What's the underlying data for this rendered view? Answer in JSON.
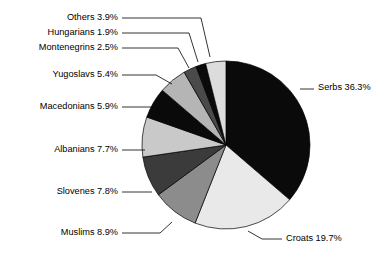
{
  "chart_data": {
    "type": "pie",
    "title": "",
    "subtitle": "",
    "xlabel": "",
    "ylabel": "",
    "legend_position": "none",
    "grid": false,
    "units": "percent",
    "total": 100.0,
    "start_angle_deg": 0,
    "direction": "clockwise",
    "categories": [
      "Serbs",
      "Croats",
      "Muslims",
      "Slovenes",
      "Albanians",
      "Macedonians",
      "Yugoslavs",
      "Montenegrins",
      "Hungarians",
      "Others"
    ],
    "values": [
      36.3,
      19.7,
      8.9,
      7.8,
      7.7,
      5.9,
      5.4,
      2.5,
      1.9,
      3.9
    ],
    "slices": [
      {
        "name": "Serbs",
        "value": 36.3,
        "label": "Serbs 36.3%",
        "color": "#0a0a0a",
        "label_side": "right",
        "label_x": 318,
        "label_y": 88,
        "leader": "M 300,89 L 314,89"
      },
      {
        "name": "Croats",
        "value": 19.7,
        "label": "Croats 19.7%",
        "color": "#e9e9e9",
        "label_side": "right",
        "label_x": 286,
        "label_y": 239,
        "leader": "M 248,231 L 262,239 L 282,239"
      },
      {
        "name": "Muslims",
        "value": 8.9,
        "label": "Muslims 8.9%",
        "color": "#8c8c8c",
        "label_side": "left",
        "label_x": 118,
        "label_y": 233,
        "leader": "M 122,233 L 160,233 L 172,222"
      },
      {
        "name": "Slovenes",
        "value": 7.8,
        "label": "Slovenes 7.8%",
        "color": "#3b3b3b",
        "label_side": "left",
        "label_x": 118,
        "label_y": 192,
        "leader": "M 122,192 L 152,192"
      },
      {
        "name": "Albanians",
        "value": 7.7,
        "label": "Albanians 7.7%",
        "color": "#c9c9c9",
        "label_side": "left",
        "label_x": 118,
        "label_y": 150,
        "leader": "M 122,150 L 145,150"
      },
      {
        "name": "Macedonians",
        "value": 5.9,
        "label": "Macedonians 5.9%",
        "color": "#0a0a0a",
        "label_side": "left",
        "label_x": 118,
        "label_y": 107,
        "leader": "M 122,107 L 154,107"
      },
      {
        "name": "Yugoslavs",
        "value": 5.4,
        "label": "Yugoslavs 5.4%",
        "color": "#b5b5b5",
        "label_side": "left",
        "label_x": 118,
        "label_y": 75,
        "leader": "M 122,75 L 156,75 L 172,84"
      },
      {
        "name": "Montenegrins",
        "value": 2.5,
        "label": "Montenegrins 2.5%",
        "color": "#4a4a4a",
        "label_side": "left",
        "label_x": 118,
        "label_y": 48,
        "leader": "M 122,48 L 178,48 L 189,68"
      },
      {
        "name": "Hungarians",
        "value": 1.9,
        "label": "Hungarians 1.9%",
        "color": "#0a0a0a",
        "label_side": "left",
        "label_x": 118,
        "label_y": 33,
        "leader": "M 122,33 L 189,33 L 198,62"
      },
      {
        "name": "Others",
        "value": 3.9,
        "label": "Others 3.9%",
        "color": "#dcdcdc",
        "label_side": "left",
        "label_x": 118,
        "label_y": 18,
        "leader": "M 122,18 L 201,18 L 210,57"
      }
    ],
    "geometry": {
      "center_x": 226,
      "center_y": 145,
      "radius": 84
    }
  }
}
